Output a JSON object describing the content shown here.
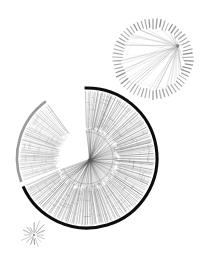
{
  "figure": {
    "name": "radial-phylogenetic-tree-figure",
    "background": "#ffffff",
    "width": 209,
    "height": 267,
    "caption": ""
  },
  "palette": {
    "ink": "#111111",
    "dark_arc": "#0d0d0d",
    "gray_arc": "#9a9a9a",
    "branch": "#5a5a5a",
    "branch_light": "#8d8d8d",
    "chord": "#a8a8a8",
    "tick": "#7b7b7b",
    "background": "#ffffff"
  },
  "chart_data": {
    "type": "scatter",
    "title": "",
    "subtitle": "",
    "xlabel": "",
    "ylabel": "",
    "grid": false,
    "legend": "none",
    "panels": [
      {
        "id": "main-tree",
        "label": "large radial tree",
        "kind": "circular-dendrogram",
        "center_x": 87,
        "center_y": 158,
        "radius": 70,
        "hub_radius": 26,
        "leaf_count": 230,
        "arc_start_deg": -92,
        "arc_sweep_deg": 248,
        "ring_stroke": "#0d0d0d",
        "ring_width": 3.1,
        "branch_color": "#5a5a5a",
        "notes": "dark outer ring over most of circumference; wedge gap at lower-left"
      },
      {
        "id": "gray-clade",
        "label": "gray highlighted clade",
        "kind": "circular-dendrogram-sector",
        "center_x": 87,
        "center_y": 158,
        "radius": 70,
        "hub_radius": 26,
        "leaf_count": 58,
        "arc_start_deg": 160,
        "arc_sweep_deg": 74,
        "ring_stroke": "#9a9a9a",
        "ring_width": 2.6,
        "branch_color": "#8d8d8d"
      },
      {
        "id": "top-network",
        "label": "small circular network",
        "kind": "chord-circle",
        "center_x": 153,
        "center_y": 59,
        "radius": 41,
        "tick_count": 62,
        "tick_inner": 31,
        "tick_outer": 41,
        "chord_count": 46,
        "hub_angle_deg": -28,
        "hub_radius": 28,
        "tick_color": "#7b7b7b",
        "chord_color": "#a8a8a8"
      },
      {
        "id": "mini-starburst",
        "label": "small starburst",
        "kind": "star",
        "center_x": 34,
        "center_y": 235,
        "radius": 15,
        "spoke_count": 16,
        "spoke_color": "#8d8d8d"
      }
    ]
  }
}
